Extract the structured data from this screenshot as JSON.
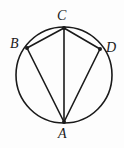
{
  "figure": {
    "name": "cyclic-quadrilateral-diagram",
    "background_color": "#fdfdfd",
    "stroke_color": "#1a1a1a",
    "circle": {
      "center_x": 64,
      "center_y": 75,
      "radius": 48,
      "stroke_width": 1.6
    },
    "vertices": [
      {
        "id": "A",
        "label": "A",
        "x": 64,
        "y": 122,
        "dot_radius": 2.0,
        "label_x": 58,
        "label_y": 127
      },
      {
        "id": "B",
        "label": "B",
        "x": 27,
        "y": 48,
        "dot_radius": 2.0,
        "label_x": 10,
        "label_y": 37
      },
      {
        "id": "C",
        "label": "C",
        "x": 64,
        "y": 28,
        "dot_radius": 2.0,
        "label_x": 57,
        "label_y": 9
      },
      {
        "id": "D",
        "label": "D",
        "x": 100,
        "y": 49,
        "dot_radius": 2.0,
        "label_x": 106,
        "label_y": 41
      }
    ],
    "chords": [
      {
        "id": "BC",
        "from": "B",
        "to": "C",
        "x1": 27,
        "y1": 48,
        "x2": 64,
        "y2": 28
      },
      {
        "id": "CD",
        "from": "C",
        "to": "D",
        "x1": 64,
        "y1": 28,
        "x2": 100,
        "y2": 49
      },
      {
        "id": "BA",
        "from": "B",
        "to": "A",
        "x1": 27,
        "y1": 48,
        "x2": 64,
        "y2": 122
      },
      {
        "id": "DA",
        "from": "D",
        "to": "A",
        "x1": 100,
        "y1": 49,
        "x2": 64,
        "y2": 122
      },
      {
        "id": "CA",
        "from": "C",
        "to": "A",
        "x1": 64,
        "y1": 28,
        "x2": 64,
        "y2": 122
      }
    ]
  }
}
